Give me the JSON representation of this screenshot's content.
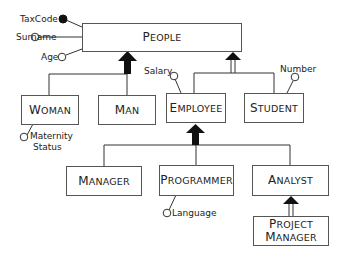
{
  "diagram": {
    "type": "ER generalization hierarchy",
    "entities": {
      "people": {
        "first": "P",
        "rest": "EOPLE"
      },
      "woman": {
        "first": "W",
        "rest": "OMAN"
      },
      "man": {
        "first": "M",
        "rest": "AN"
      },
      "employee": {
        "first": "E",
        "rest": "MPLOYEE"
      },
      "student": {
        "first": "S",
        "rest": "TUDENT"
      },
      "manager": {
        "first": "M",
        "rest": "ANAGER"
      },
      "programmer": {
        "first": "P",
        "rest": "ROGRAMMER"
      },
      "analyst": {
        "first": "A",
        "rest": "NALYST"
      },
      "project_manager": {
        "line1_first": "P",
        "line1_rest": "ROJECT",
        "line2_first": "M",
        "line2_rest": "ANAGER"
      }
    },
    "attributes": {
      "taxcode": "TaxCode",
      "surname": "Surname",
      "age": "Age",
      "maternity_line1": "Maternity",
      "maternity_line2": "Status",
      "salary": "Salary",
      "number": "Number",
      "language": "Language"
    },
    "generalizations": [
      {
        "parent": "People",
        "children": [
          "Woman",
          "Man"
        ],
        "type": "total"
      },
      {
        "parent": "People",
        "children": [
          "Employee",
          "Student"
        ],
        "type": "partial"
      },
      {
        "parent": "Employee",
        "children": [
          "Manager",
          "Programmer",
          "Analyst"
        ],
        "type": "total"
      },
      {
        "parent": "Analyst",
        "children": [
          "Project Manager"
        ],
        "type": "partial"
      }
    ],
    "identifier": "TaxCode"
  }
}
